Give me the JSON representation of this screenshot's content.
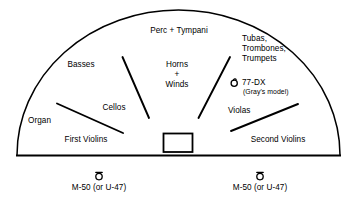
{
  "diagram": {
    "stage": {
      "shape": "semicircle",
      "baseline_label": "stage-front-edge"
    },
    "podium": {
      "name": "conductor-podium"
    },
    "sections": [
      {
        "id": "perc-tympani",
        "label": "Perc + Tympani",
        "x": 179,
        "y": 30,
        "align": "center"
      },
      {
        "id": "basses",
        "label": "Basses",
        "x": 81,
        "y": 64,
        "align": "center"
      },
      {
        "id": "horns-winds",
        "label": "Horns\n+\nWinds",
        "x": 177,
        "y": 66,
        "align": "center"
      },
      {
        "id": "brass",
        "label": "Tubas,\nTrombones,\nTrumpets",
        "x": 242,
        "y": 40,
        "align": "left"
      },
      {
        "id": "cellos",
        "label": "Cellos",
        "x": 114,
        "y": 107,
        "align": "center"
      },
      {
        "id": "organ",
        "label": "Organ",
        "x": 28,
        "y": 120,
        "align": "left"
      },
      {
        "id": "first-violins",
        "label": "First Violins",
        "x": 86,
        "y": 139,
        "align": "center"
      },
      {
        "id": "violas",
        "label": "Violas",
        "x": 228,
        "y": 110,
        "align": "left"
      },
      {
        "id": "second-violins",
        "label": "Second Violins",
        "x": 278,
        "y": 139,
        "align": "center"
      }
    ],
    "microphones": [
      {
        "id": "mic-77dx",
        "icon": "ribbon-microphone-icon",
        "label": "77-DX",
        "sublabel": "(Gray's model)",
        "icon_x": 234,
        "icon_y": 82,
        "label_x": 242,
        "label_y": 78,
        "sublabel_x": 243,
        "sublabel_y": 88
      },
      {
        "id": "mic-left-m50",
        "icon": "omni-microphone-icon",
        "label": "M-50 (or U-47)",
        "icon_x": 99,
        "icon_y": 175,
        "label_x": 99,
        "label_y": 186
      },
      {
        "id": "mic-right-m50",
        "icon": "omni-microphone-icon",
        "label": "M-50 (or U-47)",
        "icon_x": 260,
        "icon_y": 175,
        "label_x": 260,
        "label_y": 186
      }
    ],
    "colors": {
      "background": "#ffffff",
      "stroke": "#000000",
      "text": "#000000"
    }
  }
}
